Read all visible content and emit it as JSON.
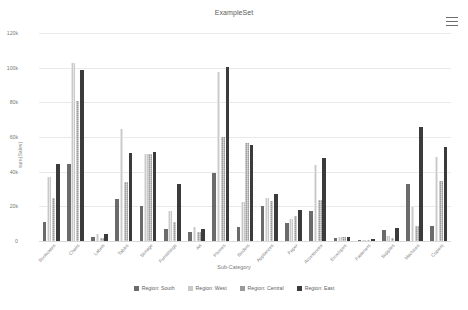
{
  "header": {
    "title": "ExampleSet",
    "menu_icon": "hamburger-menu-icon"
  },
  "chart_data": {
    "type": "bar",
    "title": "ExampleSet",
    "xlabel": "Sub-Category",
    "ylabel": "sum(Sales)",
    "ylim": [
      0,
      120000
    ],
    "grid": true,
    "legend_position": "bottom",
    "ytick_labels": [
      "0",
      "20k",
      "40k",
      "60k",
      "80k",
      "100k",
      "120k"
    ],
    "ytick_values": [
      0,
      20000,
      40000,
      60000,
      80000,
      100000,
      120000
    ],
    "categories": [
      "Bookcases",
      "Chairs",
      "Labels",
      "Tables",
      "Storage",
      "Furnishings",
      "Art",
      "Phones",
      "Binders",
      "Appliances",
      "Paper",
      "Accessories",
      "Envelopes",
      "Fasteners",
      "Supplies",
      "Machines",
      "Copiers"
    ],
    "series": [
      {
        "name": "Region: South",
        "color": "#6b6b6b",
        "values": [
          11000,
          44500,
          2200,
          24200,
          20300,
          6800,
          5200,
          39500,
          7900,
          20400,
          10200,
          17300,
          1600,
          400,
          6400,
          33000,
          8800
        ]
      },
      {
        "name": "Region: West",
        "color": "#c9c9c9",
        "values": [
          37000,
          102500,
          3900,
          64500,
          50200,
          17500,
          8000,
          97500,
          22700,
          24700,
          12600,
          43700,
          2400,
          600,
          3000,
          19400,
          48200
        ]
      },
      {
        "name": "Region: Central",
        "color": "#9a9a9a",
        "values": [
          25000,
          80500,
          2000,
          34000,
          50100,
          10800,
          5000,
          59800,
          56500,
          23300,
          14500,
          23800,
          2300,
          300,
          2000,
          8700,
          34500
        ]
      },
      {
        "name": "Region: East",
        "color": "#3b3b3b",
        "values": [
          44700,
          98400,
          4300,
          50900,
          51100,
          33000,
          7200,
          100600,
          55400,
          27000,
          18100,
          47700,
          2200,
          900,
          7600,
          66000,
          54300
        ]
      }
    ]
  },
  "legend": {
    "items": [
      {
        "label": "Region: South",
        "swatch": "#6b6b6b"
      },
      {
        "label": "Region: West",
        "swatch": "#c9c9c9"
      },
      {
        "label": "Region: Central",
        "swatch": "#9a9a9a"
      },
      {
        "label": "Region: East",
        "swatch": "#3b3b3b"
      }
    ]
  }
}
